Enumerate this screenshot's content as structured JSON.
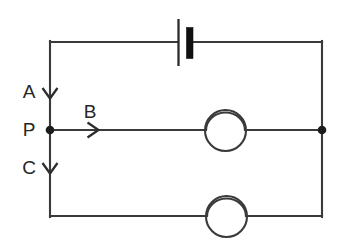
{
  "diagram": {
    "type": "circuit-schematic",
    "background_color": "#ffffff",
    "line_color": "#3a3a3a",
    "text_color": "#262626",
    "labels": {
      "a": "A",
      "b": "B",
      "c": "C",
      "p": "P"
    },
    "components": {
      "battery": {
        "name": "battery-cell",
        "position": "top-branch-center"
      },
      "lamp_middle": {
        "name": "lamp-middle-branch",
        "position": "middle-branch"
      },
      "lamp_bottom": {
        "name": "lamp-bottom-branch",
        "position": "bottom-branch"
      }
    },
    "nodes": {
      "p_node": "P",
      "right_node": ""
    },
    "current_arrows": [
      {
        "label": "A",
        "direction": "down",
        "branch": "left-upper"
      },
      {
        "label": "B",
        "direction": "right",
        "branch": "middle"
      },
      {
        "label": "C",
        "direction": "down",
        "branch": "left-lower"
      }
    ],
    "geometry": {
      "left_x": 50,
      "right_x": 322,
      "top_y": 42,
      "middle_y": 130,
      "bottom_y": 216
    }
  }
}
